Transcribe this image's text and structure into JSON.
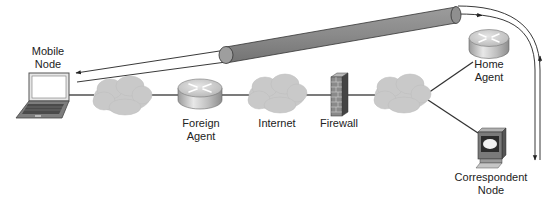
{
  "diagram": {
    "type": "network-topology",
    "colors": {
      "background": "#ffffff",
      "link": "#333333",
      "cloud": "#c8c8c8",
      "tunnel": "#8a8a8a",
      "router_top": "#d0d0d0",
      "firewall": "#7a7a7a"
    },
    "nodes": [
      {
        "id": "mobile-node",
        "icon": "laptop-icon",
        "label_lines": [
          "Mobile",
          "Node"
        ]
      },
      {
        "id": "cloud-1",
        "icon": "cloud-icon",
        "label_lines": []
      },
      {
        "id": "foreign-agent",
        "icon": "router-icon",
        "label_lines": [
          "Foreign",
          "Agent"
        ]
      },
      {
        "id": "internet",
        "icon": "cloud-icon",
        "label_lines": [
          "Internet"
        ]
      },
      {
        "id": "firewall",
        "icon": "firewall-icon",
        "label_lines": [
          "Firewall"
        ]
      },
      {
        "id": "cloud-2",
        "icon": "cloud-icon",
        "label_lines": []
      },
      {
        "id": "home-agent",
        "icon": "router-icon",
        "label_lines": [
          "Home",
          "Agent"
        ]
      },
      {
        "id": "correspondent-node",
        "icon": "workstation-icon",
        "label_lines": [
          "Correspondent",
          "Node"
        ]
      }
    ],
    "links": [
      [
        "mobile-node",
        "cloud-1"
      ],
      [
        "cloud-1",
        "foreign-agent"
      ],
      [
        "foreign-agent",
        "internet"
      ],
      [
        "internet",
        "firewall"
      ],
      [
        "firewall",
        "cloud-2"
      ],
      [
        "cloud-2",
        "home-agent"
      ],
      [
        "cloud-2",
        "correspondent-node"
      ]
    ],
    "tunnel": {
      "from": "foreign-agent",
      "to": "home-agent",
      "icon": "tunnel-pipe-icon"
    },
    "flows": [
      {
        "name": "correspondent-to-mobile",
        "direction": "correspondent-node -> home-agent -> tunnel -> mobile-node",
        "arrowhead": "at-mobile-node"
      },
      {
        "name": "mobile-to-correspondent",
        "direction": "mobile-node -> tunnel -> home-agent -> correspondent-node",
        "arrowhead": "at-correspondent-node"
      }
    ]
  },
  "labels": {
    "mobile_node": {
      "line1": "Mobile",
      "line2": "Node"
    },
    "foreign_agent": {
      "line1": "Foreign",
      "line2": "Agent"
    },
    "internet": {
      "line1": "Internet"
    },
    "firewall": {
      "line1": "Firewall"
    },
    "home_agent": {
      "line1": "Home",
      "line2": "Agent"
    },
    "correspondent_node": {
      "line1": "Correspondent",
      "line2": "Node"
    }
  }
}
